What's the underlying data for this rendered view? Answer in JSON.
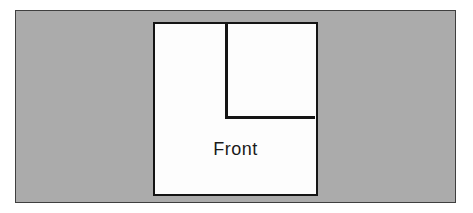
{
  "figure": {
    "label": "Front",
    "colors": {
      "background": "#ffffff",
      "panel_fill": "#ababab",
      "panel_border": "#3f3f3f",
      "shape_fill": "#fdfdfd",
      "line_color": "#141414",
      "text_color": "#1a1a1a"
    }
  }
}
